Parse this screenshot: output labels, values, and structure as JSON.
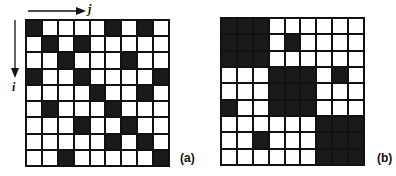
{
  "figure": {
    "panels": [
      {
        "id": "a",
        "label": "(a)",
        "rows": 9,
        "cols": 9,
        "row_axis_label": "i",
        "col_axis_label": "j",
        "filled_cells": [
          [
            0,
            0
          ],
          [
            0,
            5
          ],
          [
            0,
            7
          ],
          [
            1,
            1
          ],
          [
            1,
            3
          ],
          [
            2,
            2
          ],
          [
            2,
            6
          ],
          [
            3,
            0
          ],
          [
            3,
            3
          ],
          [
            3,
            8
          ],
          [
            4,
            4
          ],
          [
            4,
            7
          ],
          [
            5,
            1
          ],
          [
            5,
            5
          ],
          [
            6,
            3
          ],
          [
            6,
            6
          ],
          [
            7,
            5
          ],
          [
            7,
            7
          ],
          [
            8,
            2
          ],
          [
            8,
            8
          ]
        ]
      },
      {
        "id": "b",
        "label": "(b)",
        "rows": 9,
        "cols": 9,
        "filled_cells": [
          [
            0,
            0
          ],
          [
            0,
            1
          ],
          [
            0,
            2
          ],
          [
            1,
            0
          ],
          [
            1,
            1
          ],
          [
            1,
            2
          ],
          [
            2,
            0
          ],
          [
            2,
            1
          ],
          [
            2,
            2
          ],
          [
            1,
            4
          ],
          [
            3,
            3
          ],
          [
            3,
            4
          ],
          [
            3,
            5
          ],
          [
            4,
            3
          ],
          [
            4,
            4
          ],
          [
            4,
            5
          ],
          [
            5,
            3
          ],
          [
            5,
            4
          ],
          [
            5,
            5
          ],
          [
            3,
            7
          ],
          [
            5,
            0
          ],
          [
            6,
            6
          ],
          [
            6,
            7
          ],
          [
            6,
            8
          ],
          [
            7,
            6
          ],
          [
            7,
            7
          ],
          [
            7,
            8
          ],
          [
            8,
            6
          ],
          [
            8,
            7
          ],
          [
            8,
            8
          ],
          [
            7,
            2
          ]
        ]
      }
    ],
    "colors": {
      "filled": "#1a1a1a",
      "empty": "#ffffff",
      "grid_line": "#111111"
    }
  }
}
